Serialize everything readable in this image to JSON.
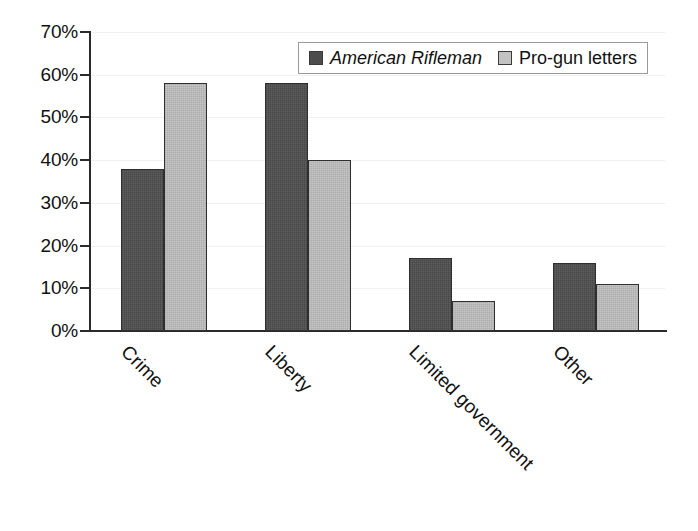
{
  "chart_data": {
    "type": "bar",
    "title": "",
    "subtitle": "",
    "xlabel": "",
    "ylabel": "",
    "categories": [
      "Crime",
      "Liberty",
      "Limited government",
      "Other"
    ],
    "series": [
      {
        "name": "American Rifleman",
        "style": "italic",
        "color": "#4c4c4c",
        "values": [
          38,
          58,
          17,
          16
        ]
      },
      {
        "name": "Pro-gun letters",
        "style": "normal",
        "color": "#b6b6b6",
        "values": [
          58,
          40,
          7,
          11
        ]
      }
    ],
    "ylim": [
      0,
      70
    ],
    "ytick_step": 10,
    "ytick_labels": [
      "0%",
      "10%",
      "20%",
      "30%",
      "40%",
      "50%",
      "60%",
      "70%"
    ],
    "ytick_values": [
      0,
      10,
      20,
      30,
      40,
      50,
      60,
      70
    ],
    "grid": true,
    "grid_color": "#f1f1f1",
    "legend_position": "top-right",
    "xtick_label_rotation": 45,
    "axis_color": "#2b2b2b",
    "background": "#ffffff"
  },
  "legend": {
    "entries": [
      {
        "label": "American Rifleman",
        "swatch": "legend-swatch-american-rifleman"
      },
      {
        "label": "Pro-gun letters",
        "swatch": "legend-swatch-pro-gun-letters"
      }
    ]
  }
}
